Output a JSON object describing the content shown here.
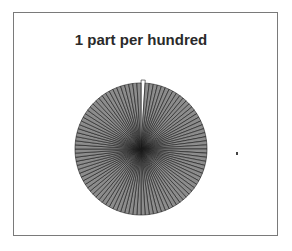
{
  "chart_data": {
    "type": "pie",
    "title": "1 part per hundred",
    "slice_count": 100,
    "values": [
      1,
      1,
      1,
      1,
      1,
      1,
      1,
      1,
      1,
      1,
      1,
      1,
      1,
      1,
      1,
      1,
      1,
      1,
      1,
      1,
      1,
      1,
      1,
      1,
      1,
      1,
      1,
      1,
      1,
      1,
      1,
      1,
      1,
      1,
      1,
      1,
      1,
      1,
      1,
      1,
      1,
      1,
      1,
      1,
      1,
      1,
      1,
      1,
      1,
      1,
      1,
      1,
      1,
      1,
      1,
      1,
      1,
      1,
      1,
      1,
      1,
      1,
      1,
      1,
      1,
      1,
      1,
      1,
      1,
      1,
      1,
      1,
      1,
      1,
      1,
      1,
      1,
      1,
      1,
      1,
      1,
      1,
      1,
      1,
      1,
      1,
      1,
      1,
      1,
      1,
      1,
      1,
      1,
      1,
      1,
      1,
      1,
      1,
      1,
      1
    ],
    "highlighted_index": 0,
    "colors": {
      "highlight": "#ffffff",
      "other": "#8c8c8c",
      "edge": "#1a1a1a"
    },
    "legend": "none",
    "center": [
      141,
      149
    ],
    "radius": 66
  }
}
